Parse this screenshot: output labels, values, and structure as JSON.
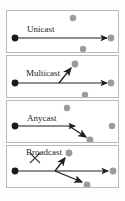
{
  "caption": {
    "text": "图 1-8 单播、多播、任播和广播"
  },
  "colors": {
    "source_node": "#1a1a1a",
    "dest_node": "#9b9b9b",
    "arrow": "#1f1f1f",
    "panel_border": "#b9b9b9",
    "panel_background": "#ffffff",
    "page_background": "#fdfdfc",
    "cross_mark": "#3a3a3a"
  },
  "panels": [
    {
      "label": "Unicast",
      "nodes": {
        "source": {
          "x": 8,
          "y": 27,
          "r": 3.4,
          "kind": "source"
        },
        "destinations": [
          {
            "x": 66,
            "y": 7,
            "r": 3.2,
            "kind": "idle"
          },
          {
            "x": 104,
            "y": 27,
            "r": 3.4,
            "kind": "target"
          },
          {
            "x": 76,
            "y": 38,
            "r": 3.2,
            "kind": "idle"
          }
        ]
      },
      "arrows": [
        {
          "from": [
            8,
            27
          ],
          "to": [
            102,
            27
          ],
          "kind": "delivered"
        }
      ],
      "cross_mark": false
    },
    {
      "label": "Multicast",
      "nodes": {
        "source": {
          "x": 8,
          "y": 27,
          "r": 3.4,
          "kind": "source"
        },
        "destinations": [
          {
            "x": 68,
            "y": 8,
            "r": 3.4,
            "kind": "target"
          },
          {
            "x": 104,
            "y": 27,
            "r": 3.4,
            "kind": "target"
          },
          {
            "x": 78,
            "y": 39,
            "r": 3.2,
            "kind": "idle"
          }
        ]
      },
      "arrows": [
        {
          "from": [
            8,
            27
          ],
          "to": [
            102,
            27
          ],
          "kind": "delivered"
        },
        {
          "from": [
            52,
            27
          ],
          "to": [
            65,
            11
          ],
          "kind": "delivered"
        }
      ],
      "cross_mark": false
    },
    {
      "label": "Anycast",
      "nodes": {
        "source": {
          "x": 8,
          "y": 25,
          "r": 3.4,
          "kind": "source"
        },
        "destinations": [
          {
            "x": 60,
            "y": 7,
            "r": 3.2,
            "kind": "idle"
          },
          {
            "x": 105,
            "y": 25,
            "r": 3.2,
            "kind": "idle"
          },
          {
            "x": 83,
            "y": 39,
            "r": 3.4,
            "kind": "target"
          }
        ]
      },
      "arrows": [
        {
          "from": [
            8,
            25
          ],
          "to": [
            70,
            25
          ],
          "kind": "partial"
        },
        {
          "from": [
            62,
            25
          ],
          "to": [
            81,
            37
          ],
          "kind": "delivered"
        }
      ],
      "cross_mark": false
    },
    {
      "label": "Broadcast",
      "nodes": {
        "source": {
          "x": 8,
          "y": 25,
          "r": 3.4,
          "kind": "source"
        },
        "destinations": [
          {
            "x": 62,
            "y": 7,
            "r": 3.4,
            "kind": "target"
          },
          {
            "x": 106,
            "y": 25,
            "r": 3.4,
            "kind": "target"
          },
          {
            "x": 80,
            "y": 39,
            "r": 3.4,
            "kind": "target"
          }
        ]
      },
      "arrows": [
        {
          "from": [
            8,
            25
          ],
          "to": [
            103,
            25
          ],
          "kind": "delivered"
        },
        {
          "from": [
            48,
            25
          ],
          "to": [
            59,
            11
          ],
          "kind": "delivered"
        },
        {
          "from": [
            48,
            25
          ],
          "to": [
            77,
            37
          ],
          "kind": "delivered"
        }
      ],
      "cross_mark": true,
      "cross": {
        "cx": 28,
        "cy": 12,
        "size": 9
      }
    }
  ]
}
